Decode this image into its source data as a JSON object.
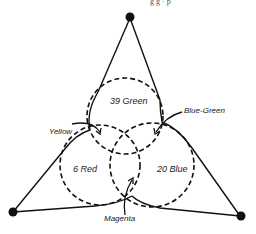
{
  "header": {
    "cutoff_text": "g g · p   "
  },
  "diagram": {
    "labels": {
      "green": "39 Green",
      "red": "6 Red",
      "blue": "20 Blue",
      "yellow": "Yellow",
      "blue_green": "Blue-Green",
      "magenta": "Magenta"
    },
    "nodes": [
      "top",
      "bottom-left",
      "bottom-right"
    ],
    "circles": [
      "green",
      "red",
      "blue"
    ],
    "colors": {
      "line": "#111111",
      "background": "#ffffff"
    }
  }
}
